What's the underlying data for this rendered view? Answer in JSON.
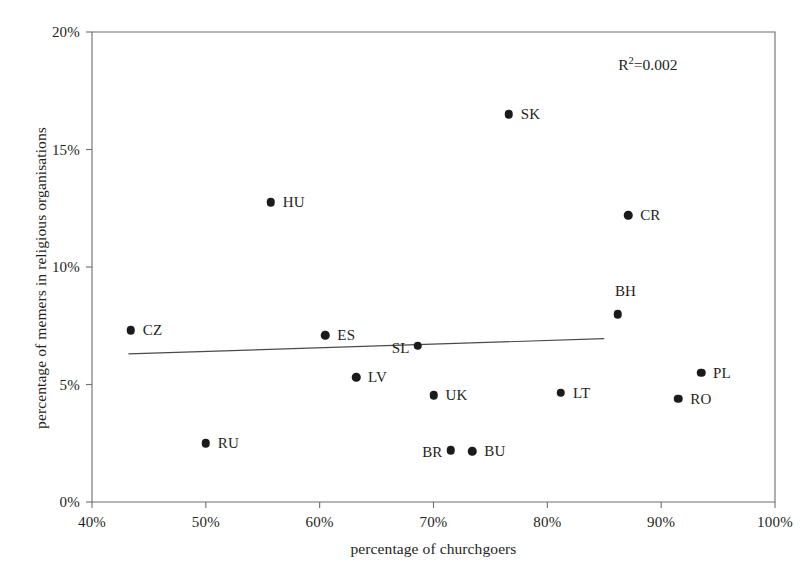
{
  "chart_data": {
    "type": "scatter",
    "title": "",
    "xlabel": "percentage of churchgoers",
    "ylabel": "percentage of memers in religious organisations",
    "xlim": [
      40,
      100
    ],
    "ylim": [
      0,
      20
    ],
    "xticks": [
      "40%",
      "50%",
      "60%",
      "70%",
      "80%",
      "90%",
      "100%"
    ],
    "xtick_values": [
      40,
      50,
      60,
      70,
      80,
      90,
      100
    ],
    "yticks": [
      "0%",
      "5%",
      "10%",
      "15%",
      "20%"
    ],
    "ytick_values": [
      0,
      5,
      10,
      15,
      20
    ],
    "grid": false,
    "legend": "none",
    "annotations": [
      {
        "name": "r-squared",
        "text": "R²=0.002",
        "r2_value": 0.002,
        "x": 91.5,
        "y": 18.6
      }
    ],
    "trendline": {
      "type": "linear",
      "x_start": 43.2,
      "y_start": 6.3,
      "x_end": 85.0,
      "y_end": 6.95
    },
    "points": [
      {
        "label": "CZ",
        "x": 43.4,
        "y": 7.3,
        "label_side": "right"
      },
      {
        "label": "RU",
        "x": 50.0,
        "y": 2.5,
        "label_side": "right"
      },
      {
        "label": "HU",
        "x": 55.7,
        "y": 12.75,
        "label_side": "right"
      },
      {
        "label": "ES",
        "x": 60.5,
        "y": 7.1,
        "label_side": "right"
      },
      {
        "label": "LV",
        "x": 63.2,
        "y": 5.3,
        "label_side": "right"
      },
      {
        "label": "SL",
        "x": 68.6,
        "y": 6.65,
        "label_side": "left"
      },
      {
        "label": "UK",
        "x": 70.0,
        "y": 4.55,
        "label_side": "right"
      },
      {
        "label": "BR",
        "x": 71.5,
        "y": 2.2,
        "label_side": "left"
      },
      {
        "label": "BU",
        "x": 73.4,
        "y": 2.15,
        "label_side": "right"
      },
      {
        "label": "SK",
        "x": 76.6,
        "y": 16.5,
        "label_side": "right"
      },
      {
        "label": "LT",
        "x": 81.2,
        "y": 4.65,
        "label_side": "right"
      },
      {
        "label": "BH",
        "x": 86.2,
        "y": 8.0,
        "label_side": "above"
      },
      {
        "label": "CR",
        "x": 87.1,
        "y": 12.2,
        "label_side": "right"
      },
      {
        "label": "RO",
        "x": 91.5,
        "y": 4.4,
        "label_side": "right"
      },
      {
        "label": "PL",
        "x": 93.5,
        "y": 5.5,
        "label_side": "right"
      }
    ]
  },
  "colors": {
    "marker": "#1b1b1b",
    "axis": "#6e6e6e",
    "trendline": "#4a4a4a",
    "text": "#231f20",
    "background": "#ffffff"
  }
}
